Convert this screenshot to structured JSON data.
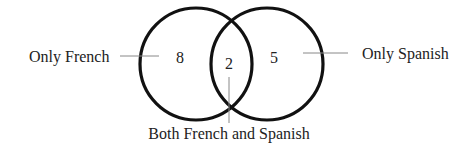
{
  "diagram": {
    "type": "venn",
    "sets": [
      {
        "name": "French",
        "region_label": "Only French",
        "count": "8"
      },
      {
        "name": "Spanish",
        "region_label": "Only Spanish",
        "count": "5"
      }
    ],
    "intersection": {
      "region_label": "Both French and Spanish",
      "count": "2"
    }
  },
  "colors": {
    "circle_stroke": "#111111",
    "leader_line": "#888888",
    "text": "#222222",
    "background": "#ffffff"
  }
}
